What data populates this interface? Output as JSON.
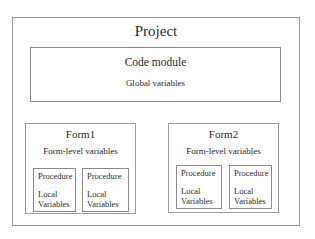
{
  "project": {
    "title": "Project",
    "code_module": {
      "title": "Code module",
      "subtitle": "Global variables"
    },
    "forms": [
      {
        "title": "Form1",
        "subtitle": "Form-level variables",
        "procedures": [
          {
            "title": "Procedure",
            "line1": "Local",
            "line2": "Variables"
          },
          {
            "title": "Procedure",
            "line1": "Local",
            "line2": "Variables"
          }
        ]
      },
      {
        "title": "Form2",
        "subtitle": "Form-level variables",
        "procedures": [
          {
            "title": "Procedure",
            "line1": "Local",
            "line2": "Variables"
          },
          {
            "title": "Procedure",
            "line1": "Local",
            "line2": "Variables"
          }
        ]
      }
    ]
  },
  "colors": {
    "border": "#8c8c8c",
    "text": "#2a2a2a",
    "background": "#ffffff"
  }
}
